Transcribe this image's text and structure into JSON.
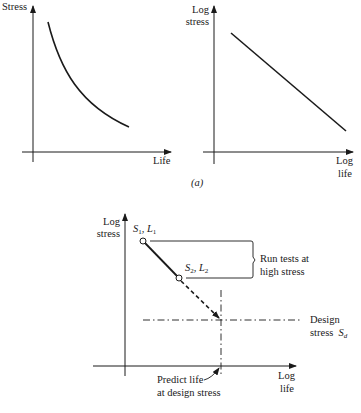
{
  "figure": {
    "panel_a_label": "(a)",
    "top_left_chart": {
      "y_label": "Stress",
      "x_label": "Life",
      "curve": "decreasing convex curve (stress vs life)"
    },
    "top_right_chart": {
      "y_label_line1": "Log",
      "y_label_line2": "stress",
      "x_label_line1": "Log",
      "x_label_line2": "life",
      "curve": "straight decreasing line"
    },
    "bottom_chart": {
      "y_label_line1": "Log",
      "y_label_line2": "stress",
      "x_label_line1": "Log",
      "x_label_line2": "life",
      "point1": {
        "s": "S",
        "s_sub": "1",
        "sep": ", ",
        "l": "L",
        "l_sub": "1"
      },
      "point2": {
        "s": "S",
        "s_sub": "2",
        "sep": ", ",
        "l": "L",
        "l_sub": "2"
      },
      "bracket_label_line1": "Run tests at",
      "bracket_label_line2": "high stress",
      "design_label_line1": "Design",
      "design_label_line2": "stress",
      "design_symbol": "S",
      "design_symbol_sub": "d",
      "predict_label_line1": "Predict life",
      "predict_label_line2": "at design stress"
    }
  }
}
